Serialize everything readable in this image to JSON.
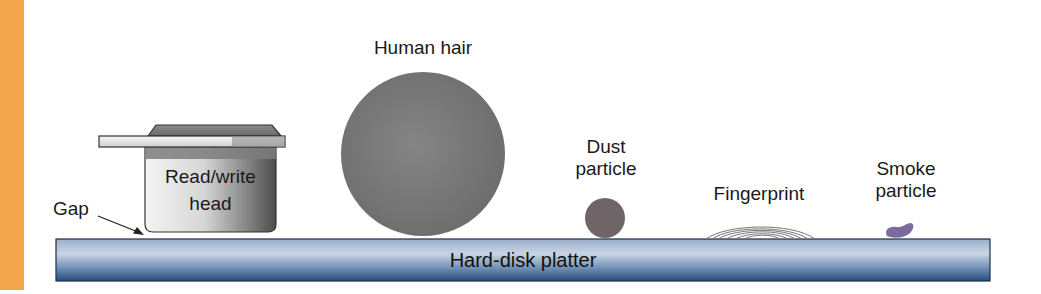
{
  "colors": {
    "accent_bar": "#f4a64c",
    "platter_light": "#aebfd6",
    "platter_dark": "#2c5585",
    "hair": "#7a7a7a",
    "dust": "#6f6468",
    "smoke": "#7b6aa0",
    "head_light": "#f0f0f0",
    "head_dark": "#555555"
  },
  "labels": {
    "human_hair": "Human hair",
    "dust_line1": "Dust",
    "dust_line2": "particle",
    "fingerprint": "Fingerprint",
    "smoke_line1": "Smoke",
    "smoke_line2": "particle",
    "gap": "Gap",
    "head_line1": "Read/write",
    "head_line2": "head",
    "platter": "Hard-disk platter"
  }
}
